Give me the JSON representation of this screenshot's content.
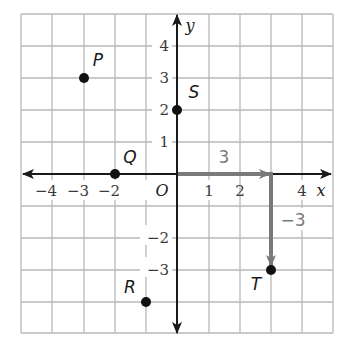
{
  "diagram": {
    "type": "coordinate-plane",
    "grid": {
      "x_min": -5,
      "x_max": 5,
      "y_min": -5,
      "y_max": 5,
      "step": 1
    },
    "axes": {
      "x_label": "x",
      "y_label": "y",
      "origin_label": "O",
      "x_ticks": [
        "−4",
        "−3",
        "−2",
        "1",
        "2",
        "4"
      ],
      "x_tick_values": [
        -4,
        -3,
        -2,
        1,
        2,
        4
      ],
      "y_ticks": [
        "4",
        "3",
        "2",
        "1",
        "−2",
        "−3"
      ],
      "y_tick_values": [
        4,
        3,
        2,
        1,
        -2,
        -3
      ]
    },
    "points": [
      {
        "label": "P",
        "x": -3,
        "y": 3
      },
      {
        "label": "Q",
        "x": -2,
        "y": 0
      },
      {
        "label": "R",
        "x": -1,
        "y": -4
      },
      {
        "label": "S",
        "x": 0,
        "y": 2
      },
      {
        "label": "T",
        "x": 3,
        "y": -3
      }
    ],
    "translation_vectors": [
      {
        "label": "3",
        "from": [
          0,
          0
        ],
        "to": [
          3,
          0
        ]
      },
      {
        "label": "−3",
        "from": [
          3,
          0
        ],
        "to": [
          3,
          -3
        ]
      }
    ],
    "colors": {
      "grid": "#b8b8b8",
      "axis": "#1a1a1a",
      "vector": "#7a7a7a",
      "point": "#111111"
    }
  }
}
